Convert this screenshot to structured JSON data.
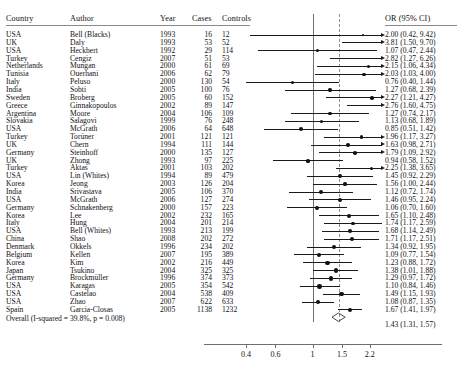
{
  "columns": {
    "country": "Country",
    "author": "Author",
    "year": "Year",
    "cases": "Cases",
    "controls": "Controls",
    "or": "OR  (95% CI)"
  },
  "overall_label": "Overall (I-squared = 39.8%, p = 0.008)",
  "chart_data": {
    "type": "forest",
    "title": "",
    "xlabel": "",
    "ylabel": "",
    "x_scale": "log",
    "xlim": [
      0.33,
      2.6
    ],
    "tick_values": [
      0.4,
      0.6,
      1,
      1.5,
      2.2
    ],
    "tick_labels": [
      "0.4",
      "0.6",
      "1",
      "1.5",
      "2.2"
    ],
    "null_line": 1,
    "summary_line": 1.43,
    "grid": false,
    "legend": "none",
    "effect_measure": "OR",
    "heterogeneity": "I-squared = 39.8%, p = 0.008",
    "summary": {
      "label": "Overall (I-squared = 39.8%, p = 0.008)",
      "or": 1.43,
      "lcl": 1.31,
      "ucl": 1.57,
      "or_text": "1.43 (1.31, 1.57)"
    },
    "studies": [
      {
        "country": "USA",
        "author": "Bell (Blacks)",
        "year": "1993",
        "cases": "16",
        "controls": "12",
        "or": 2.0,
        "lcl": 0.42,
        "ucl": 9.42,
        "or_text": "2.00 (0.42, 9.42)",
        "truncated_right": false
      },
      {
        "country": "UK",
        "author": "Daly",
        "year": "1993",
        "cases": "53",
        "controls": "52",
        "or": 3.81,
        "lcl": 1.5,
        "ucl": 9.7,
        "or_text": "3.81 (1.50, 9.70)",
        "truncated_right": true
      },
      {
        "country": "USA",
        "author": "Heckbert",
        "year": "1992",
        "cases": "29",
        "controls": "114",
        "or": 1.07,
        "lcl": 0.47,
        "ucl": 2.44,
        "or_text": "1.07 (0.47, 2.44)",
        "truncated_right": false
      },
      {
        "country": "Turkey",
        "author": "Cengiz",
        "year": "2007",
        "cases": "51",
        "controls": "53",
        "or": 2.82,
        "lcl": 1.27,
        "ucl": 6.26,
        "or_text": "2.82 (1.27, 6.26)",
        "truncated_right": false
      },
      {
        "country": "Netherlands",
        "author": "Mungan",
        "year": "2000",
        "cases": "61",
        "controls": "69",
        "or": 2.15,
        "lcl": 1.06,
        "ucl": 4.34,
        "or_text": "2.15 (1.06, 4.34)",
        "truncated_right": false
      },
      {
        "country": "Tunisia",
        "author": "Ouerhani",
        "year": "2006",
        "cases": "62",
        "controls": "79",
        "or": 2.03,
        "lcl": 1.03,
        "ucl": 4.0,
        "or_text": "2.03 (1.03, 4.00)",
        "truncated_right": false
      },
      {
        "country": "Italy",
        "author": "Peluso",
        "year": "2000",
        "cases": "130",
        "controls": "54",
        "or": 0.76,
        "lcl": 0.4,
        "ucl": 1.44,
        "or_text": "0.76 (0.40, 1.44)",
        "truncated_right": false
      },
      {
        "country": "India",
        "author": "Sobti",
        "year": "2005",
        "cases": "100",
        "controls": "76",
        "or": 1.27,
        "lcl": 0.68,
        "ucl": 2.39,
        "or_text": "1.27 (0.68, 2.39)",
        "truncated_right": false
      },
      {
        "country": "Sweden",
        "author": "Broberg",
        "year": "2005",
        "cases": "60",
        "controls": "152",
        "or": 2.27,
        "lcl": 1.21,
        "ucl": 4.27,
        "or_text": "2.27 (1.21, 4.27)",
        "truncated_right": false
      },
      {
        "country": "Greece",
        "author": "Ginnakopoulos",
        "year": "2002",
        "cases": "89",
        "controls": "147",
        "or": 2.76,
        "lcl": 1.6,
        "ucl": 4.75,
        "or_text": "2.76 (1.60, 4.75)",
        "truncated_right": false
      },
      {
        "country": "Argentina",
        "author": "Moore",
        "year": "2004",
        "cases": "106",
        "controls": "109",
        "or": 1.27,
        "lcl": 0.74,
        "ucl": 2.17,
        "or_text": "1.27 (0.74, 2.17)",
        "truncated_right": false
      },
      {
        "country": "Slovakia",
        "author": "Salagovi",
        "year": "1999",
        "cases": "76",
        "controls": "248",
        "or": 1.13,
        "lcl": 0.68,
        "ucl": 1.89,
        "or_text": "1.13 (0.68, 1.89)",
        "truncated_right": false
      },
      {
        "country": "USA",
        "author": "McGrath",
        "year": "2006",
        "cases": "64",
        "controls": "648",
        "or": 0.85,
        "lcl": 0.51,
        "ucl": 1.42,
        "or_text": "0.85 (0.51, 1.42)",
        "truncated_right": false
      },
      {
        "country": "Turkey",
        "author": "Torüner",
        "year": "2001",
        "cases": "121",
        "controls": "121",
        "or": 1.96,
        "lcl": 1.17,
        "ucl": 3.27,
        "or_text": "1.96 (1.17, 3.27)",
        "truncated_right": false
      },
      {
        "country": "UK",
        "author": "Chern",
        "year": "1994",
        "cases": "111",
        "controls": "144",
        "or": 1.63,
        "lcl": 0.98,
        "ucl": 2.71,
        "or_text": "1.63 (0.98, 2.71)",
        "truncated_right": false
      },
      {
        "country": "Germany",
        "author": "Steinhoff",
        "year": "2000",
        "cases": "135",
        "controls": "127",
        "or": 1.79,
        "lcl": 1.09,
        "ucl": 2.92,
        "or_text": "1.79 (1.09, 2.92)",
        "truncated_right": false
      },
      {
        "country": "UK",
        "author": "Zhong",
        "year": "1993",
        "cases": "97",
        "controls": "225",
        "or": 0.94,
        "lcl": 0.58,
        "ucl": 1.52,
        "or_text": "0.94 (0.58, 1.52)",
        "truncated_right": false
      },
      {
        "country": "Turkey",
        "author": "Aktas",
        "year": "2001",
        "cases": "103",
        "controls": "202",
        "or": 2.25,
        "lcl": 1.38,
        "ucl": 3.65,
        "or_text": "2.25 (1.38, 3.65)",
        "truncated_right": false
      },
      {
        "country": "USA",
        "author": "Lin (Whites)",
        "year": "1994",
        "cases": "89",
        "controls": "479",
        "or": 1.45,
        "lcl": 0.92,
        "ucl": 2.29,
        "or_text": "1.45 (0.92, 2.29)",
        "truncated_right": false
      },
      {
        "country": "Korea",
        "author": "Jeong",
        "year": "2003",
        "cases": "126",
        "controls": "204",
        "or": 1.56,
        "lcl": 1.0,
        "ucl": 2.44,
        "or_text": "1.56 (1.00, 2.44)",
        "truncated_right": false
      },
      {
        "country": "India",
        "author": "Srivastava",
        "year": "2005",
        "cases": "106",
        "controls": "370",
        "or": 1.12,
        "lcl": 0.72,
        "ucl": 1.74,
        "or_text": "1.12 (0.72, 1.74)",
        "truncated_right": false
      },
      {
        "country": "USA",
        "author": "McGrath",
        "year": "2006",
        "cases": "127",
        "controls": "274",
        "or": 1.46,
        "lcl": 0.95,
        "ucl": 2.24,
        "or_text": "1.46 (0.95, 2.24)",
        "truncated_right": false
      },
      {
        "country": "Germany",
        "author": "Schnakenberg",
        "year": "2000",
        "cases": "157",
        "controls": "223",
        "or": 1.06,
        "lcl": 0.7,
        "ucl": 1.6,
        "or_text": "1.06 (0.70, 1.60)",
        "truncated_right": false
      },
      {
        "country": "Korea",
        "author": "Lee",
        "year": "2002",
        "cases": "232",
        "controls": "165",
        "or": 1.65,
        "lcl": 1.1,
        "ucl": 2.48,
        "or_text": "1.65 (1.10, 2.48)",
        "truncated_right": false
      },
      {
        "country": "Italy",
        "author": "Hung",
        "year": "2004",
        "cases": "201",
        "controls": "214",
        "or": 1.74,
        "lcl": 1.17,
        "ucl": 2.59,
        "or_text": "1.74 (1.17, 2.59)",
        "truncated_right": false
      },
      {
        "country": "USA",
        "author": "Bell (Whites)",
        "year": "1993",
        "cases": "213",
        "controls": "199",
        "or": 1.68,
        "lcl": 1.14,
        "ucl": 2.49,
        "or_text": "1.68 (1.14, 2.49)",
        "truncated_right": false
      },
      {
        "country": "China",
        "author": "Shao",
        "year": "2008",
        "cases": "202",
        "controls": "272",
        "or": 1.71,
        "lcl": 1.17,
        "ucl": 2.51,
        "or_text": "1.71 (1.17, 2.51)",
        "truncated_right": false
      },
      {
        "country": "Denmark",
        "author": "Okkels",
        "year": "1996",
        "cases": "234",
        "controls": "202",
        "or": 1.34,
        "lcl": 0.92,
        "ucl": 1.95,
        "or_text": "1.34 (0.92, 1.95)",
        "truncated_right": false
      },
      {
        "country": "Belgium",
        "author": "Kellen",
        "year": "2007",
        "cases": "195",
        "controls": "389",
        "or": 1.09,
        "lcl": 0.77,
        "ucl": 1.54,
        "or_text": "1.09 (0.77, 1.54)",
        "truncated_right": false
      },
      {
        "country": "Korea",
        "author": "Kim",
        "year": "2002",
        "cases": "216",
        "controls": "449",
        "or": 1.23,
        "lcl": 0.88,
        "ucl": 1.72,
        "or_text": "1.23 (0.88, 1.72)",
        "truncated_right": false
      },
      {
        "country": "Japan",
        "author": "Tsukino",
        "year": "2004",
        "cases": "325",
        "controls": "325",
        "or": 1.38,
        "lcl": 1.01,
        "ucl": 1.88,
        "or_text": "1.38 (1.01, 1.88)",
        "truncated_right": false
      },
      {
        "country": "Germany",
        "author": "Brockmüller",
        "year": "1996",
        "cases": "374",
        "controls": "373",
        "or": 1.29,
        "lcl": 0.97,
        "ucl": 1.72,
        "or_text": "1.29 (0.97, 1.72)",
        "truncated_right": false
      },
      {
        "country": "USA",
        "author": "Karagas",
        "year": "2005",
        "cases": "354",
        "controls": "542",
        "or": 1.1,
        "lcl": 0.84,
        "ucl": 1.46,
        "or_text": "1.10 (0.84, 1.46)",
        "truncated_right": false
      },
      {
        "country": "USA",
        "author": "Castelao",
        "year": "2004",
        "cases": "538",
        "controls": "409",
        "or": 1.49,
        "lcl": 1.15,
        "ucl": 1.93,
        "or_text": "1.49 (1.15, 1.93)",
        "truncated_right": false
      },
      {
        "country": "USA",
        "author": "Zhao",
        "year": "2007",
        "cases": "622",
        "controls": "633",
        "or": 1.08,
        "lcl": 0.87,
        "ucl": 1.35,
        "or_text": "1.08 (0.87, 1.35)",
        "truncated_right": false
      },
      {
        "country": "Spain",
        "author": "Garcia-Closas",
        "year": "2005",
        "cases": "1138",
        "controls": "1232",
        "or": 1.67,
        "lcl": 1.41,
        "ucl": 1.97,
        "or_text": "1.67 (1.41, 1.97)",
        "truncated_right": false
      }
    ]
  }
}
